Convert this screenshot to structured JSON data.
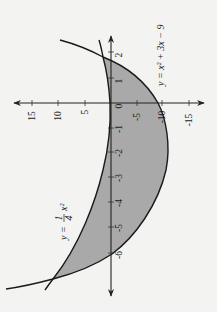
{
  "figure": {
    "orientation": "rotated 90 degrees counterclockwise",
    "background_color": "#f3f3f1",
    "shade_color": "#a9a9a9",
    "line_color": "#1a1a1a"
  },
  "axes": {
    "x_ticks": [
      "2",
      "1",
      "0",
      "-1",
      "-2",
      "-3",
      "-4",
      "-5",
      "-6"
    ],
    "y_ticks": [
      "15",
      "10",
      "5",
      "-5",
      "-10",
      "-15"
    ]
  },
  "curves": [
    {
      "name": "upper-parabola",
      "label": "y = ¼x²",
      "label_prefix": "y = ",
      "label_frac_num": "1",
      "label_frac_den": "4",
      "label_suffix": "x²"
    },
    {
      "name": "lower-parabola",
      "label": "y = x² + 3x − 9"
    }
  ],
  "shaded_region": {
    "between": [
      "y = ¼x²",
      "y = x² + 3x − 9"
    ],
    "x_range": [
      -6,
      2
    ]
  }
}
